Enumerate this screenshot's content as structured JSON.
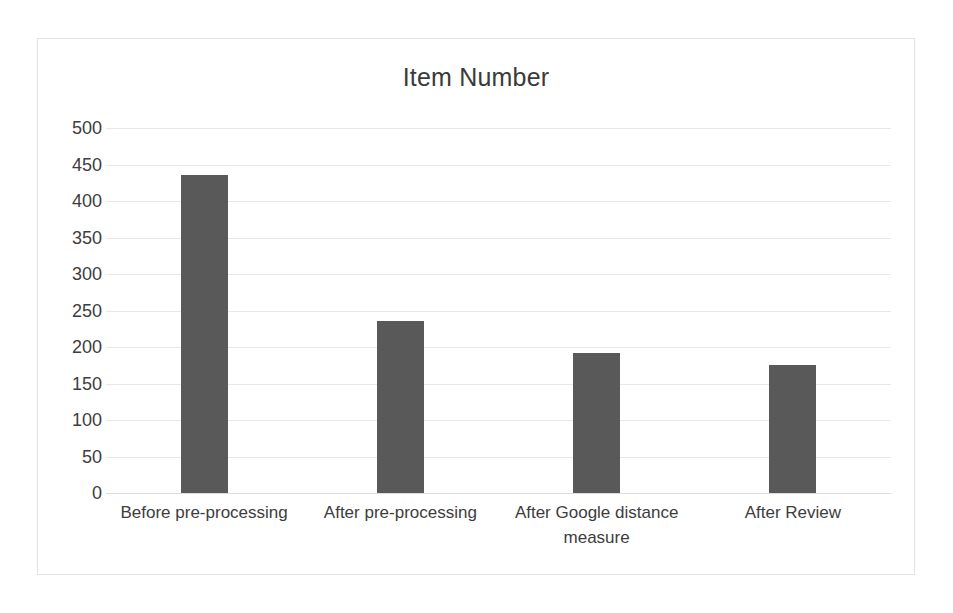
{
  "chart_data": {
    "type": "bar",
    "title": "Item Number",
    "xlabel": "",
    "ylabel": "",
    "categories": [
      "Before pre-processing",
      "After pre-processing",
      "After Google distance measure",
      "After Review"
    ],
    "values": [
      435,
      235,
      192,
      175
    ],
    "ylim": [
      0,
      500
    ],
    "ytick_labels": [
      "500",
      "450",
      "400",
      "350",
      "300",
      "250",
      "200",
      "150",
      "100",
      "50",
      "0"
    ],
    "ytick_values": [
      500,
      450,
      400,
      350,
      300,
      250,
      200,
      150,
      100,
      50,
      0
    ],
    "grid": true,
    "legend": false,
    "legend_position": "none",
    "series": [
      {
        "name": "Item Number",
        "values": [
          435,
          235,
          192,
          175
        ]
      }
    ],
    "colors": {
      "bar_fill": "#595959",
      "gridline": "#e8e8e8",
      "text": "#3d3d3d",
      "title_text": "#3a3a3a",
      "frame_border": "#e2e2e2",
      "background": "#ffffff"
    }
  }
}
